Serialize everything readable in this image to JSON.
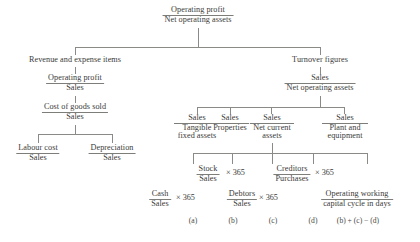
{
  "diagram": {
    "root": {
      "numerator": "Operating profit",
      "denominator": "Net operating assets"
    },
    "left_branch": {
      "heading": "Revenue and expense items",
      "ratio1": {
        "numerator": "Operating profit",
        "denominator": "Sales"
      },
      "ratio2": {
        "numerator": "Cost of goods sold",
        "denominator": "Sales"
      },
      "children": [
        {
          "numerator": "Labour cost",
          "denominator": "Sales"
        },
        {
          "numerator": "Depreciation",
          "denominator": "Sales"
        }
      ]
    },
    "right_branch": {
      "heading": "Turnover figures",
      "ratio": {
        "numerator": "Sales",
        "denominator": "Net operating assets"
      },
      "children": [
        {
          "numerator": "Sales",
          "denominator": "Tangible fixed assets"
        },
        {
          "numerator": "Sales",
          "denominator": "Properties"
        },
        {
          "numerator": "Sales",
          "denominator": "Net current assets"
        },
        {
          "numerator": "Sales",
          "denominator": "Plant and equipment"
        }
      ],
      "working_capital": [
        {
          "numerator": "Cash",
          "denominator": "Sales",
          "multiplier": "× 365",
          "tag": "(a)"
        },
        {
          "numerator": "Stock",
          "denominator": "Sales",
          "multiplier": "× 365",
          "tag": "(b)"
        },
        {
          "numerator": "Debtors",
          "denominator": "Sales",
          "multiplier": "× 365",
          "tag": "(c)"
        },
        {
          "numerator": "Creditors",
          "denominator": "Purchases",
          "multiplier": "× 365",
          "tag": "(d)"
        }
      ],
      "cycle": {
        "line1": "Operating working",
        "line2": "capital cycle in days",
        "formula": "(b) + (c) − (d)"
      }
    }
  }
}
